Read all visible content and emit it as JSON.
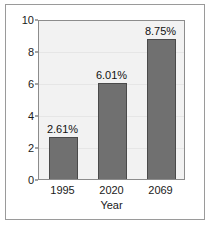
{
  "chart_data": {
    "type": "bar",
    "title": "",
    "subtitle": "",
    "xlabel": "Year",
    "ylabel": "",
    "categories": [
      "1995",
      "2020",
      "2069"
    ],
    "values": [
      2.61,
      6.01,
      8.75
    ],
    "data_labels": [
      "2.61%",
      "6.01%",
      "8.75%"
    ],
    "series": [
      {
        "name": "",
        "values": [
          2.61,
          6.01,
          8.75
        ]
      }
    ],
    "ylim": [
      0,
      10
    ],
    "yticks": [
      0,
      2,
      4,
      6,
      8,
      10
    ],
    "ytick_labels": [
      "0",
      "2",
      "4",
      "6",
      "8",
      "10"
    ],
    "grid": true,
    "legend": false,
    "legend_position": "none",
    "colors": {
      "bar_fill": "#707070",
      "bar_edge": "#4a4a4a",
      "plot_background": "#f2f2f2",
      "figure_background": "#ffffff",
      "axis": "#8c8c8c",
      "gridline": "#e6e6e6",
      "text": "#1a1a1a",
      "frame": "#9a9a9a"
    }
  }
}
